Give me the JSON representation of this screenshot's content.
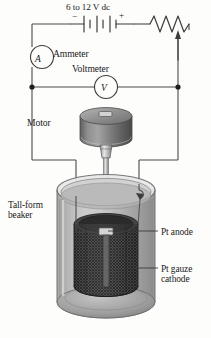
{
  "figure": {
    "name": "electrodeposition-apparatus",
    "width": 211,
    "height": 338
  },
  "labels": {
    "supply": "6 to 12 V dc",
    "ammeter": "Ammeter",
    "voltmeter": "Voltmeter",
    "motor": "Motor",
    "beaker_line1": "Tall-form",
    "beaker_line2": "beaker",
    "anode": "Pt anode",
    "cathode_line1": "Pt gauze",
    "cathode_line2": "cathode"
  },
  "symbols": {
    "ammeter_glyph": "A",
    "voltmeter_glyph": "V",
    "battery_negative": "−",
    "battery_positive": "+"
  },
  "components": [
    {
      "id": "battery",
      "name": "dc-power-supply",
      "label": "6 to 12 V dc"
    },
    {
      "id": "rheostat",
      "name": "variable-resistor",
      "label": ""
    },
    {
      "id": "ammeter",
      "name": "ammeter",
      "label": "Ammeter"
    },
    {
      "id": "voltmeter",
      "name": "voltmeter",
      "label": "Voltmeter"
    },
    {
      "id": "motor",
      "name": "stirring-motor",
      "label": "Motor"
    },
    {
      "id": "beaker",
      "name": "tall-form-beaker",
      "label": "Tall-form beaker"
    },
    {
      "id": "anode",
      "name": "pt-anode",
      "label": "Pt anode"
    },
    {
      "id": "cathode",
      "name": "pt-gauze-cathode",
      "label": "Pt gauze cathode"
    }
  ],
  "colors": {
    "line": "#4a4a4a",
    "ink": "#1a1a1a",
    "glass": "#b9b9b9",
    "glass_light": "#d8d8d8",
    "solution": "#a9a9a9",
    "motor_body": "#7a7a7a",
    "motor_top": "#9c9c9c",
    "gauze_dark": "#3c3c3c",
    "background": "#fdfdfc"
  }
}
